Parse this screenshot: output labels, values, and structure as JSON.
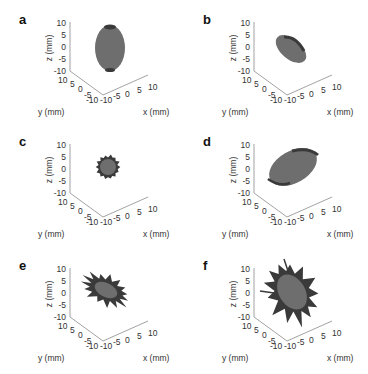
{
  "figure": {
    "panels": [
      {
        "id": "a",
        "label": "a",
        "shape": "ellipsoid-vertical"
      },
      {
        "id": "b",
        "label": "b",
        "shape": "ellipsoid-tilted-small"
      },
      {
        "id": "c",
        "label": "c",
        "shape": "sphere-small"
      },
      {
        "id": "d",
        "label": "d",
        "shape": "ellipsoid-tilted-large"
      },
      {
        "id": "e",
        "label": "e",
        "shape": "spiky-small"
      },
      {
        "id": "f",
        "label": "f",
        "shape": "spiky-large"
      }
    ],
    "axes": {
      "z_label": "z (mm)",
      "y_label": "y (mm)",
      "x_label": "x (mm)",
      "z_ticks": [
        "10",
        "5",
        "0",
        "-5",
        "-10"
      ],
      "y_ticks": [
        "10",
        "5",
        "0",
        "-5",
        "-10"
      ],
      "x_ticks": [
        "-10",
        "-5",
        "0",
        "5",
        "10"
      ]
    },
    "colors": {
      "surface": "#6e6e6e",
      "surface_dark": "#3a3a3a",
      "axis": "#888888"
    }
  },
  "chart_data": [
    {
      "type": "scatter",
      "title": "a",
      "subtitle": "3D surface plot: near-ellipsoidal object, elongated along z",
      "xlabel": "x (mm)",
      "ylabel": "y (mm)",
      "zlabel": "z (mm)",
      "xlim": [
        -10,
        10
      ],
      "ylim": [
        -10,
        10
      ],
      "zlim": [
        -10,
        10
      ],
      "x_ticks": [
        -10,
        -5,
        0,
        5,
        10
      ],
      "y_ticks": [
        -10,
        -5,
        0,
        5,
        10
      ],
      "z_ticks": [
        -10,
        -5,
        0,
        5,
        10
      ],
      "grid": false
    },
    {
      "type": "scatter",
      "title": "b",
      "subtitle": "3D surface plot: smaller tilted ellipsoid",
      "xlabel": "x (mm)",
      "ylabel": "y (mm)",
      "zlabel": "z (mm)",
      "xlim": [
        -10,
        10
      ],
      "ylim": [
        -10,
        10
      ],
      "zlim": [
        -10,
        10
      ],
      "x_ticks": [
        -10,
        -5,
        0,
        5,
        10
      ],
      "y_ticks": [
        -10,
        -5,
        0,
        5,
        10
      ],
      "z_ticks": [
        -10,
        -5,
        0,
        5,
        10
      ],
      "grid": false
    },
    {
      "type": "scatter",
      "title": "c",
      "subtitle": "3D surface plot: small sphere",
      "xlabel": "x (mm)",
      "ylabel": "y (mm)",
      "zlabel": "z (mm)",
      "xlim": [
        -10,
        10
      ],
      "ylim": [
        -10,
        10
      ],
      "zlim": [
        -10,
        10
      ],
      "x_ticks": [
        -10,
        -5,
        0,
        5,
        10
      ],
      "y_ticks": [
        -10,
        -5,
        0,
        5,
        10
      ],
      "z_ticks": [
        -10,
        -5,
        0,
        5,
        10
      ],
      "grid": false
    },
    {
      "type": "scatter",
      "title": "d",
      "subtitle": "3D surface plot: large tilted ellipsoid",
      "xlabel": "x (mm)",
      "ylabel": "y (mm)",
      "zlabel": "z (mm)",
      "xlim": [
        -10,
        10
      ],
      "ylim": [
        -10,
        10
      ],
      "zlim": [
        -10,
        10
      ],
      "x_ticks": [
        -10,
        -5,
        0,
        5,
        10
      ],
      "y_ticks": [
        -10,
        -5,
        0,
        5,
        10
      ],
      "z_ticks": [
        -10,
        -5,
        0,
        5,
        10
      ],
      "grid": false
    },
    {
      "type": "scatter",
      "title": "e",
      "subtitle": "3D surface plot: small spiculated object",
      "xlabel": "x (mm)",
      "ylabel": "y (mm)",
      "zlabel": "z (mm)",
      "xlim": [
        -10,
        10
      ],
      "ylim": [
        -10,
        10
      ],
      "zlim": [
        -10,
        10
      ],
      "x_ticks": [
        -10,
        -5,
        0,
        5,
        10
      ],
      "y_ticks": [
        -10,
        -5,
        0,
        5,
        10
      ],
      "z_ticks": [
        -10,
        -5,
        0,
        5,
        10
      ],
      "grid": false
    },
    {
      "type": "scatter",
      "title": "f",
      "subtitle": "3D surface plot: larger spiculated object",
      "xlabel": "x (mm)",
      "ylabel": "y (mm)",
      "zlabel": "z (mm)",
      "xlim": [
        -10,
        10
      ],
      "ylim": [
        -10,
        10
      ],
      "zlim": [
        -10,
        10
      ],
      "x_ticks": [
        -10,
        -5,
        0,
        5,
        10
      ],
      "y_ticks": [
        -10,
        -5,
        0,
        5,
        10
      ],
      "z_ticks": [
        -10,
        -5,
        0,
        5,
        10
      ],
      "grid": false
    }
  ]
}
